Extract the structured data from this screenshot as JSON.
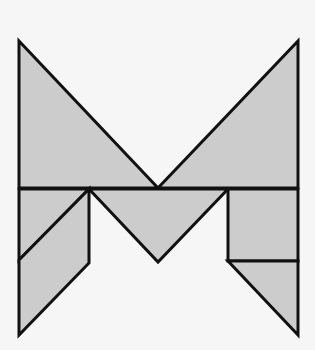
{
  "figure": {
    "background": "#f6f6f6",
    "fill": "#cccccc",
    "stroke": "#111111",
    "stroke_width": 3,
    "pieces": [
      {
        "name": "large-triangle-left",
        "points": "19,41 158,188 19,188"
      },
      {
        "name": "large-triangle-right",
        "points": "298,41 298,188 158,188"
      },
      {
        "name": "medium-triangle-middle",
        "points": "89,189 228,189 158,262"
      },
      {
        "name": "small-triangle-left",
        "points": "19,189 89,189 19,260"
      },
      {
        "name": "parallelogram-left",
        "points": "89,189 89,263 19,335 19,260"
      },
      {
        "name": "square-right",
        "points": "228,189 298,189 298,261 228,261"
      },
      {
        "name": "small-triangle-right",
        "points": "228,261 298,261 298,335"
      }
    ]
  }
}
